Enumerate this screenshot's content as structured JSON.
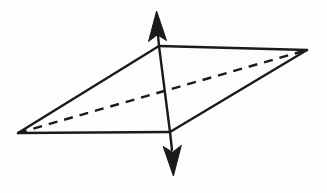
{
  "figure": {
    "type": "line-diagram",
    "canvas": {
      "width": 327,
      "height": 193
    },
    "background_color": "#fdfdfd",
    "stroke_color": "#1a1a1a",
    "stroke_width": 2.4,
    "dash_pattern": "9 7",
    "vertices": {
      "left": {
        "name": "left-vertex",
        "x": 18,
        "y": 133
      },
      "top": {
        "name": "top-vertex",
        "x": 159,
        "y": 46
      },
      "right": {
        "name": "right-vertex",
        "x": 307,
        "y": 50
      },
      "bottom": {
        "name": "bottom-vertex",
        "x": 170,
        "y": 132
      }
    },
    "edges": [
      {
        "name": "edge-left-to-top",
        "style": "solid",
        "x1": 18,
        "y1": 133,
        "x2": 159,
        "y2": 46
      },
      {
        "name": "edge-top-to-right",
        "style": "solid",
        "x1": 159,
        "y1": 46,
        "x2": 307,
        "y2": 50
      },
      {
        "name": "edge-left-to-bottom",
        "style": "solid",
        "x1": 18,
        "y1": 133,
        "x2": 170,
        "y2": 132
      },
      {
        "name": "edge-bottom-to-right",
        "style": "solid",
        "x1": 170,
        "y1": 132,
        "x2": 307,
        "y2": 50
      },
      {
        "name": "edge-vertical-axis",
        "style": "solid",
        "x1": 159,
        "y1": 46,
        "x2": 170,
        "y2": 132
      },
      {
        "name": "edge-diagonal-hidden",
        "style": "dashed",
        "x1": 18,
        "y1": 133,
        "x2": 307,
        "y2": 50
      }
    ],
    "arrows": [
      {
        "name": "up-arrow",
        "direction": "up",
        "shaft": {
          "x1": 159,
          "y1": 46,
          "x2": 157,
          "y2": 24
        },
        "head_path": "M 156.6 11 L 166.5 40.5 L 157.4 34.8 L 148.5 41.5 Z"
      },
      {
        "name": "down-arrow",
        "direction": "down",
        "shaft": {
          "x1": 170,
          "y1": 132,
          "x2": 172,
          "y2": 150
        },
        "head_path": "M 173.4 176 L 163.2 146.5 L 172.6 152.2 L 181.3 145.4 Z"
      }
    ]
  }
}
